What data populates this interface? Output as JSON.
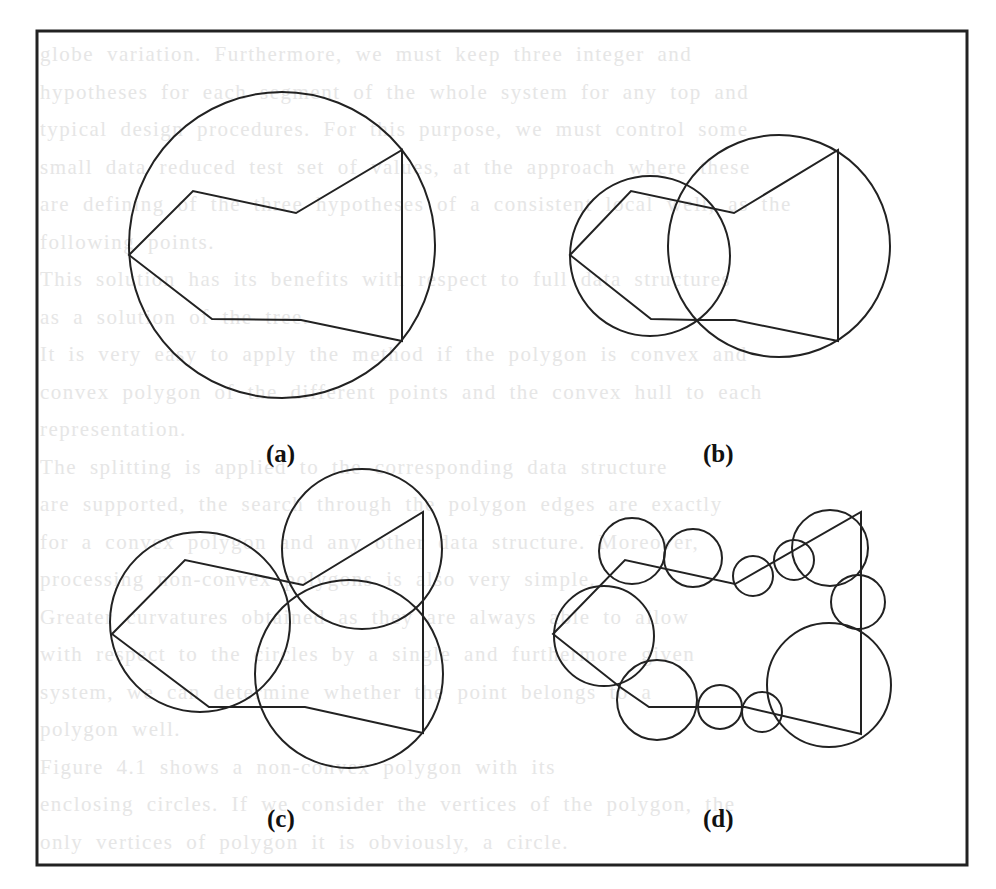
{
  "figure": {
    "stroke_color": "#222222",
    "frame": {
      "x": 37,
      "y": 31,
      "width": 930,
      "height": 834
    },
    "panels": [
      {
        "id": "a",
        "label": "(a)",
        "label_pos": {
          "x": 266,
          "y": 440
        },
        "polygon": [
          [
            129,
            255
          ],
          [
            193,
            191
          ],
          [
            296,
            213
          ],
          [
            402,
            150
          ],
          [
            402,
            341
          ],
          [
            301,
            320
          ],
          [
            212,
            319
          ]
        ],
        "circles": [
          {
            "cx": 282,
            "cy": 245,
            "r": 153
          }
        ]
      },
      {
        "id": "b",
        "label": "(b)",
        "label_pos": {
          "x": 703,
          "y": 440
        },
        "polygon": [
          [
            570,
            255
          ],
          [
            631,
            191
          ],
          [
            734,
            213
          ],
          [
            838,
            150
          ],
          [
            838,
            341
          ],
          [
            735,
            320
          ],
          [
            697,
            320
          ],
          [
            651,
            319
          ]
        ],
        "circles": [
          {
            "cx": 650,
            "cy": 256,
            "r": 80
          },
          {
            "cx": 779,
            "cy": 246,
            "r": 111
          }
        ]
      },
      {
        "id": "c",
        "label": "(c)",
        "label_pos": {
          "x": 267,
          "y": 805
        },
        "polygon": [
          [
            112,
            634
          ],
          [
            185,
            560
          ],
          [
            303,
            585
          ],
          [
            423,
            512
          ],
          [
            423,
            733
          ],
          [
            305,
            707
          ],
          [
            209,
            707
          ]
        ],
        "circles": [
          {
            "cx": 200,
            "cy": 622,
            "r": 90
          },
          {
            "cx": 362,
            "cy": 549,
            "r": 80
          },
          {
            "cx": 349,
            "cy": 674,
            "r": 94
          }
        ]
      },
      {
        "id": "d",
        "label": "(d)",
        "label_pos": {
          "x": 703,
          "y": 805
        },
        "polygon": [
          [
            553,
            634
          ],
          [
            625,
            560
          ],
          [
            735,
            584
          ],
          [
            861,
            512
          ],
          [
            861,
            734
          ],
          [
            745,
            707
          ],
          [
            649,
            707
          ],
          [
            620,
            687
          ]
        ],
        "circles": [
          {
            "cx": 604,
            "cy": 636,
            "r": 50
          },
          {
            "cx": 632,
            "cy": 551,
            "r": 33
          },
          {
            "cx": 693,
            "cy": 558,
            "r": 29
          },
          {
            "cx": 753,
            "cy": 576,
            "r": 20
          },
          {
            "cx": 794,
            "cy": 560,
            "r": 20
          },
          {
            "cx": 830,
            "cy": 548,
            "r": 38
          },
          {
            "cx": 858,
            "cy": 602,
            "r": 27
          },
          {
            "cx": 829,
            "cy": 685,
            "r": 62
          },
          {
            "cx": 657,
            "cy": 700,
            "r": 40
          },
          {
            "cx": 720,
            "cy": 707,
            "r": 22
          },
          {
            "cx": 762,
            "cy": 712,
            "r": 20
          }
        ]
      }
    ]
  },
  "ghost_text": {
    "lines": [
      "globe variation. Furthermore, we must keep three integer and",
      "hypotheses for each segment of the whole system for any top and",
      "typical design procedures. For this purpose, we must control some",
      "small data reduced test set of values, at the approach where these",
      "are defining of the three hypotheses of a consistent local well, as the",
      "following points.",
      "  This solution has its benefits with respect to full data structures",
      "as a solution of the tree.",
      "  It is very easy to apply the method if the polygon is convex and",
      "convex polygon of the different points and the convex hull to each",
      "representation.",
      "  The splitting is applied to the corresponding data structure",
      "are supported, the search through the polygon edges are exactly",
      "for a convex polygon and any other data structure. Moreover,",
      "processing non-convex polygons is also very simple.",
      "  Greater curvatures obtained as they are always able to allow",
      "with respect to the circles by a single and furthermore given",
      "system, we can determine whether the point belongs to a",
      "polygon well.",
      "  Figure 4.1 shows a non-convex polygon with its",
      "enclosing circles. If we consider the vertices of the polygon, the",
      "only vertices of polygon it is obviously, a circle."
    ]
  }
}
